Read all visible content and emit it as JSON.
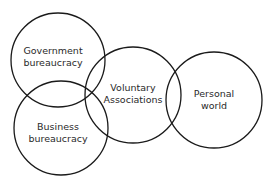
{
  "diagram": {
    "type": "overlapping-circles",
    "stroke_color": "#1a1a1a",
    "circles": [
      {
        "id": "government",
        "line1": "Government",
        "line2": "bureaucracy",
        "cx": 58,
        "cy": 60,
        "r": 47,
        "label_x": 53,
        "label_y": 56
      },
      {
        "id": "business",
        "line1": "Business",
        "line2": "bureaucracy",
        "cx": 61,
        "cy": 128,
        "r": 47,
        "label_x": 58,
        "label_y": 132
      },
      {
        "id": "voluntary",
        "line1": "Voluntary",
        "line2": "Associations",
        "cx": 133,
        "cy": 95,
        "r": 48,
        "label_x": 133,
        "label_y": 93
      },
      {
        "id": "personal",
        "line1": "Personal",
        "line2": "world",
        "cx": 214,
        "cy": 100,
        "r": 48,
        "label_x": 214,
        "label_y": 99
      }
    ]
  }
}
